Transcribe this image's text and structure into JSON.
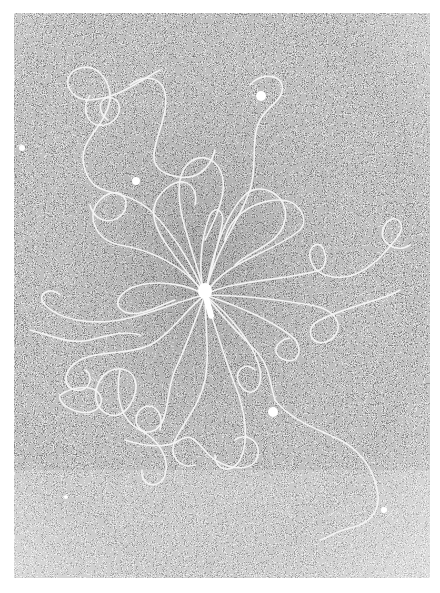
{
  "image": {
    "kind": "electron-micrograph",
    "subject": "DNA strands released radially from a central particle",
    "colors": {
      "page_background": "#ffffff",
      "field_dark": "#3a3a3a",
      "field_mid": "#8a8a8a",
      "strand": "#f4f4f4",
      "particle": "#ffffff"
    },
    "frame": {
      "x": 14,
      "y": 13,
      "width": 416,
      "height": 565
    },
    "center_particle": {
      "x": 205,
      "y": 295
    },
    "particles": [
      {
        "x": 261,
        "y": 96,
        "r": 5
      },
      {
        "x": 136,
        "y": 181,
        "r": 4
      },
      {
        "x": 22,
        "y": 148,
        "r": 3
      },
      {
        "x": 273,
        "y": 412,
        "r": 5
      },
      {
        "x": 384,
        "y": 510,
        "r": 3
      },
      {
        "x": 66,
        "y": 497,
        "r": 2
      }
    ]
  }
}
